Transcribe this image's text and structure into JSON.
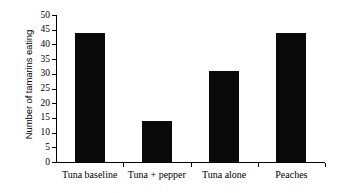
{
  "chart_data": {
    "type": "bar",
    "title": "",
    "subtitle": "",
    "xlabel": "",
    "ylabel": "Number of tamarins eating",
    "categories": [
      "Tuna baseline",
      "Tuna + pepper",
      "Tuna alone",
      "Peaches"
    ],
    "values": [
      44,
      14,
      31,
      44
    ],
    "ylim": [
      0,
      50
    ],
    "y_ticks": [
      0,
      5,
      10,
      15,
      20,
      25,
      30,
      35,
      40,
      45,
      50
    ],
    "y_tick_labels": [
      "0",
      "5",
      "10",
      "15",
      "20",
      "25",
      "30",
      "35",
      "40",
      "45",
      "50"
    ],
    "grid": false,
    "legend": false,
    "legend_position": "none",
    "bar_color": "#0a0a0a",
    "background_color": "#ffffff",
    "axis_color": "#000000",
    "series": [
      {
        "name": "Number of tamarins eating",
        "values": [
          44,
          14,
          31,
          44
        ]
      }
    ],
    "annotations": []
  }
}
